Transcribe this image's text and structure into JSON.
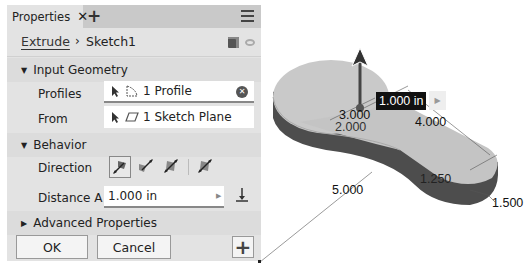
{
  "panel": {
    "tab_label": "Properties",
    "tab_close": "✕",
    "tab_add": "+",
    "breadcrumb": {
      "parent": "Extrude",
      "separator": "›",
      "current": "Sketch1"
    },
    "sections": {
      "input_geometry": {
        "title": "Input Geometry",
        "profiles_label": "Profiles",
        "profiles_value": "1 Profile",
        "from_label": "From",
        "from_value": "1 Sketch Plane"
      },
      "behavior": {
        "title": "Behavior",
        "direction_label": "Direction",
        "directions": [
          "default",
          "flipped",
          "symmetric",
          "asymmetric"
        ],
        "selected_direction": "default",
        "distance_label": "Distance A",
        "distance_value": "1.000 in"
      },
      "advanced": {
        "title": "Advanced Properties"
      }
    },
    "buttons": {
      "ok": "OK",
      "cancel": "Cancel",
      "add": "+"
    }
  },
  "viewport": {
    "extrude_value": "1.000 in",
    "dimensions": {
      "d1": "3.000",
      "d2": "2.000",
      "d3": "4.000",
      "d4": "5.000",
      "d5": "1.250",
      "d6": "1.500"
    }
  },
  "colors": {
    "panel_bg": "#e3e3e3",
    "tabbar_bg": "#c9c9c9",
    "model_top": "#c8c8c8",
    "model_side": "#4a4a4a"
  }
}
